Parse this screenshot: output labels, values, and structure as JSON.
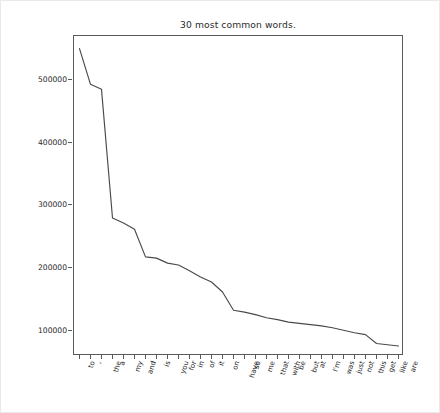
{
  "chart_data": {
    "type": "line",
    "title": "30 most common words.",
    "xlabel": "",
    "ylabel": "Count",
    "categories": [
      "to",
      ",",
      "the",
      "a",
      "my",
      "and",
      "I",
      "is",
      "you",
      "for",
      "in",
      "of",
      "it",
      "on",
      "have",
      "so",
      "me",
      "that",
      "with",
      "be",
      "but",
      "at",
      "I'm",
      "was",
      "just",
      "not",
      "this",
      "get",
      "like",
      "are"
    ],
    "values": [
      550000,
      493000,
      485000,
      280000,
      272000,
      262000,
      218000,
      216000,
      208000,
      205000,
      196000,
      186000,
      178000,
      162000,
      133000,
      130000,
      126000,
      121000,
      118000,
      114000,
      112000,
      110000,
      108000,
      105000,
      101000,
      97000,
      94000,
      80000,
      78000,
      76000
    ],
    "ylim": [
      60000,
      570000
    ],
    "yticks": [
      100000,
      200000,
      300000,
      400000,
      500000
    ],
    "ytick_labels": [
      "100000",
      "200000",
      "300000",
      "400000",
      "500000"
    ],
    "grid": false,
    "legend": false,
    "line_color": "#4a4a4a",
    "background_color": "#ffffff",
    "axis_color": "#5a5a5a"
  }
}
